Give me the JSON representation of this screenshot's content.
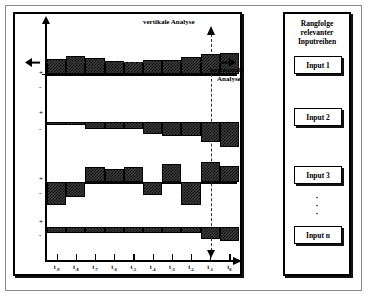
{
  "figure": {
    "title_annotations": {
      "vertical": "vertikale Analyse",
      "horizontal_line1": "horizontale",
      "horizontal_line2": "Analyse"
    }
  },
  "sidebar": {
    "title_line1": "Rangfolge",
    "title_line2": "relevanter",
    "title_line3": "Inputreihen",
    "items": [
      {
        "label": "Input 1"
      },
      {
        "label": "Input 2"
      },
      {
        "label": "Input 3"
      },
      {
        "label": "Input n"
      }
    ],
    "dots": "·"
  },
  "axis": {
    "tick_labels": [
      {
        "base": "t",
        "sub": "-9"
      },
      {
        "base": "t",
        "sub": "-8"
      },
      {
        "base": "t",
        "sub": "-7"
      },
      {
        "base": "t",
        "sub": "-6"
      },
      {
        "base": "t",
        "sub": "-5"
      },
      {
        "base": "t",
        "sub": "-4"
      },
      {
        "base": "t",
        "sub": "-3"
      },
      {
        "base": "t",
        "sub": "-2"
      },
      {
        "base": "t",
        "sub": "-1"
      },
      {
        "base": "t",
        "sub": "0"
      }
    ],
    "plus": "+",
    "minus": "-"
  },
  "chart_data": {
    "type": "bar",
    "title": "",
    "xlabel": "",
    "ylabel": "",
    "categories": [
      "t-9",
      "t-8",
      "t-7",
      "t-6",
      "t-5",
      "t-4",
      "t-3",
      "t-2",
      "t-1",
      "t0"
    ],
    "grid": false,
    "legend": "none",
    "ylim": [
      -3,
      3
    ],
    "note": "Four stacked bar panels (Input 1..n), each with a zero baseline; positive bars above, negative below.",
    "series": [
      {
        "name": "Input 1",
        "values": [
          2.1,
          2.6,
          2.3,
          1.8,
          1.7,
          2.0,
          2.0,
          2.5,
          2.8,
          3.0
        ]
      },
      {
        "name": "Input 2",
        "values": [
          -0.3,
          -0.3,
          -0.8,
          -0.8,
          -0.8,
          -1.3,
          -1.6,
          -1.6,
          -2.2,
          -2.8
        ]
      },
      {
        "name": "Input 3",
        "values": [
          -2.4,
          -1.6,
          1.6,
          1.4,
          1.6,
          -1.4,
          1.9,
          -2.4,
          2.1,
          1.7
        ]
      },
      {
        "name": "Input n",
        "values": [
          -0.7,
          -0.7,
          -0.7,
          -0.7,
          -0.7,
          -0.7,
          -0.7,
          -0.7,
          -1.3,
          -1.6
        ]
      }
    ]
  }
}
